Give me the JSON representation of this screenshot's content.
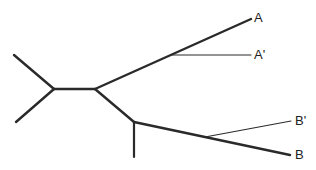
{
  "diagram": {
    "type": "unrooted phylogenetic tree",
    "labels": {
      "a": "A",
      "a_prime": "A'",
      "b_prime": "B'",
      "b": "B"
    },
    "colors": {
      "line": "#2a2a2a",
      "background": "#ffffff"
    }
  }
}
